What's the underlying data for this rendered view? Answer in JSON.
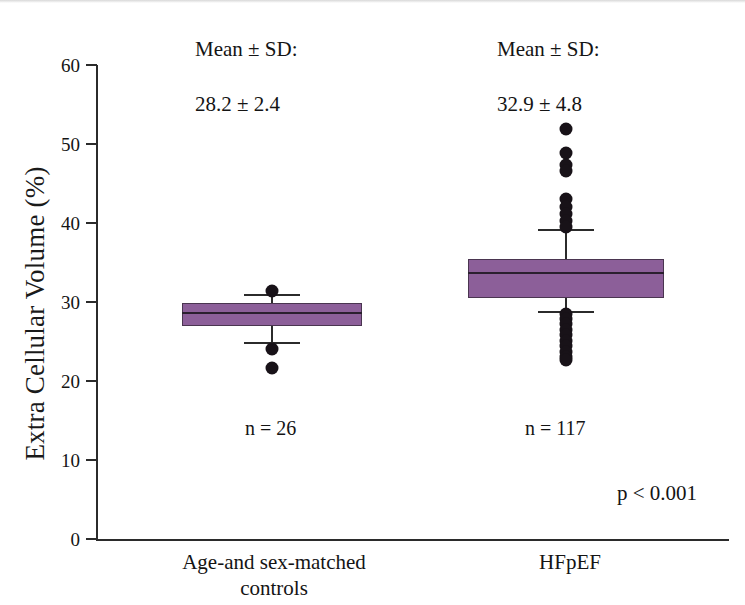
{
  "chart_data": {
    "type": "box",
    "title": "",
    "xlabel": "",
    "ylabel": "Extra Cellular Volume (%)",
    "ylim": [
      0,
      60
    ],
    "ytick_values": [
      0,
      10,
      20,
      30,
      40,
      50,
      60
    ],
    "ytick_labels": [
      "0",
      "10",
      "20",
      "30",
      "40",
      "50",
      "60"
    ],
    "grid": false,
    "legend": "none",
    "categories": [
      "Age-and sex-matched\ncontrols",
      "HFpEF"
    ],
    "annotations": {
      "p_value": "p < 0.001",
      "mean_sd_header": "Mean ± SD:"
    },
    "series": [
      {
        "name": "Age-and sex-matched controls",
        "n_label": "n = 26",
        "n": 26,
        "mean": 28.2,
        "sd": 2.4,
        "mean_sd_header": "Mean ± SD:",
        "mean_sd_value": "28.2 ± 2.4",
        "q1": 27.0,
        "median": 28.6,
        "q3": 29.9,
        "whisker_low": 24.9,
        "whisker_high": 31.0,
        "outliers": [
          31.4,
          24.1,
          21.7
        ]
      },
      {
        "name": "HFpEF",
        "n_label": "n = 117",
        "n": 117,
        "mean": 32.9,
        "sd": 4.8,
        "mean_sd_header": "Mean ± SD:",
        "mean_sd_value": "32.9 ± 4.8",
        "q1": 30.5,
        "median": 33.7,
        "q3": 35.5,
        "whisker_low": 28.8,
        "whisker_high": 39.2,
        "outliers": [
          51.9,
          48.8,
          47.4,
          46.6,
          43.1,
          42.0,
          41.2,
          40.3,
          39.5,
          28.5,
          27.9,
          27.2,
          26.5,
          25.8,
          25.1,
          24.4,
          23.7,
          23.0,
          22.6
        ]
      }
    ],
    "box_fill_color": "#8c5f99",
    "box_edge_color": "#4a3550",
    "outlier_color": "#181218",
    "axis_color": "#2b2b2b"
  },
  "axis": {
    "y_title": "Extra Cellular Volume (%)"
  }
}
